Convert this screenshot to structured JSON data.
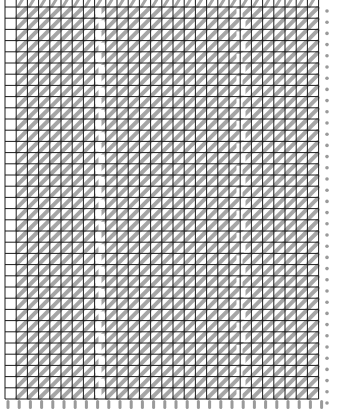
{
  "pattern": {
    "name": "hatched-grid",
    "width": 338,
    "height": 417,
    "grid": {
      "origin_x": 5,
      "origin_y": 7,
      "pitch_x": 11.2,
      "pitch_y": 11.2,
      "columns": 28,
      "rows": 35,
      "line_color": "#1a1a1a",
      "line_width": 1
    },
    "hatch": {
      "color": "#a6a6a6",
      "width": 4,
      "direction": "bottom-left-to-top-right",
      "skip_first_column": true
    },
    "gaps": [
      {
        "center_x": 100,
        "width": 6,
        "color": "#ffffff"
      },
      {
        "center_x": 241,
        "width": 6,
        "color": "#ffffff"
      }
    ],
    "pins": {
      "y": 400,
      "height": 9,
      "width": 3,
      "color": "#9a9a9a",
      "count": 29
    },
    "right_edge_dots": {
      "color": "#9a9a9a",
      "x": 327
    },
    "top_edge_dots": {
      "color": "#9a9a9a",
      "y": 3
    }
  }
}
